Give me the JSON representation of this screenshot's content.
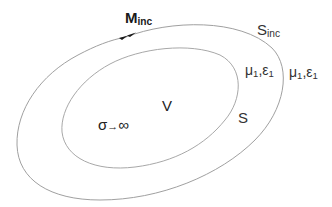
{
  "diagram": {
    "labels": {
      "m_inc": {
        "main": "M",
        "sub": "inc"
      },
      "s_inc": {
        "main": "S",
        "sub": "inc"
      },
      "inner_medium": {
        "mu": "μ",
        "mu_sub": "1",
        "sep": ",",
        "eps": "ε",
        "eps_sub": "1"
      },
      "outer_medium": {
        "mu": "μ",
        "mu_sub": "1",
        "sep": ",",
        "eps": "ε",
        "eps_sub": "1"
      },
      "volume": "V",
      "surface": "S",
      "conductivity": {
        "sigma": "σ",
        "arrow": "→",
        "infinity": "∞"
      }
    },
    "curves": {
      "outer": {
        "name": "S_inc",
        "stroke": "#a0a0a0"
      },
      "inner": {
        "name": "S",
        "stroke": "#a8a8a8"
      }
    },
    "arrow": {
      "color": "#1a1a1a",
      "direction": "clockwise"
    }
  }
}
